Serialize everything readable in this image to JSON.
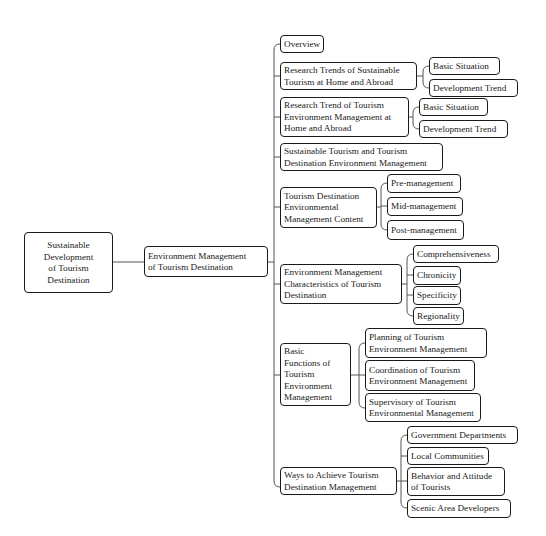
{
  "root": {
    "label": "Sustainable\nDevelopment\nof Tourism\nDestination"
  },
  "level1": {
    "label": "Environment Management\nof Tourism Destination"
  },
  "branches": [
    {
      "label": "Overview",
      "children": []
    },
    {
      "label": "Research Trends of Sustainable\nTourism at Home and Abroad",
      "children": [
        "Basic Situation",
        "Development Trend"
      ]
    },
    {
      "label": "Research Trend of Tourism\nEnvironment Management at\nHome and Abroad",
      "children": [
        "Basic Situation",
        "Development Trend"
      ]
    },
    {
      "label": "Sustainable Tourism and Tourism\nDestination Environment Management",
      "children": []
    },
    {
      "label": "Tourism Destination\nEnvironmental\nManagement Content",
      "children": [
        "Pre-management",
        "Mid-management",
        "Post-management"
      ]
    },
    {
      "label": "Environment Management\nCharacteristics of Tourism\nDestination",
      "children": [
        "Comprehensiveness",
        "Chronicity",
        "Specificity",
        "Regionality"
      ]
    },
    {
      "label": "Basic\nFunctions of\nTourism\nEnvironment\nManagement",
      "children": [
        "Planning of Tourism\nEnvironment Management",
        "Coordination of Tourism\nEnvironment Management",
        "Supervisory of Tourism\nEnvironmental Management"
      ]
    },
    {
      "label": "Ways to Achieve Tourism\nDestination Management",
      "children": [
        "Government Departments",
        "Local Communities",
        "Behavior and Attitude\nof Tourists",
        "Scenic Area Developers"
      ]
    }
  ]
}
